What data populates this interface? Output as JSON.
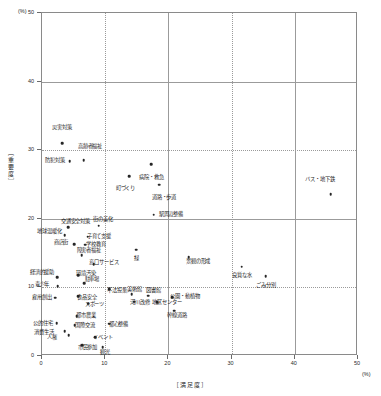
{
  "chart_data": {
    "type": "scatter",
    "title": "",
    "xlabel": "［満足度］",
    "ylabel": "［重要度］",
    "x_unit": "(%)",
    "y_unit": "(%)",
    "xlim": [
      0,
      50
    ],
    "ylim": [
      0,
      50
    ],
    "x_ticks": [
      "0",
      "10",
      "20",
      "30",
      "40",
      "50"
    ],
    "y_ticks": [
      "0",
      "10",
      "20",
      "30",
      "40",
      "50"
    ],
    "grid": true,
    "legend": "none",
    "points": [
      {
        "label": "災害対策",
        "x": 3.2,
        "y": 31.0,
        "lx": 3.2,
        "ly": 33.2
      },
      {
        "label": "防犯対策",
        "x": 4.4,
        "y": 28.4,
        "lx": 2.0,
        "ly": 28.4
      },
      {
        "label": "高齢者福祉",
        "x": 6.6,
        "y": 28.5,
        "lx": 7.6,
        "ly": 30.4
      },
      {
        "label": "病院・救急",
        "x": 17.3,
        "y": 28.0,
        "lx": 17.3,
        "ly": 26.0
      },
      {
        "label": "町づくり",
        "x": 13.8,
        "y": 26.2,
        "lx": 13.2,
        "ly": 24.3
      },
      {
        "label": "道路・歩道",
        "x": 18.5,
        "y": 25.0,
        "lx": 19.3,
        "ly": 23.1
      },
      {
        "label": "バス・地下鉄",
        "x": 45.7,
        "y": 23.6,
        "lx": 44.0,
        "ly": 25.6
      },
      {
        "label": "駅周辺整備",
        "x": 17.7,
        "y": 20.6,
        "lx": 20.4,
        "ly": 20.6
      },
      {
        "label": "交通安全対策",
        "x": 4.1,
        "y": 18.8,
        "lx": 5.3,
        "ly": 19.6
      },
      {
        "label": "街の美化",
        "x": 9.0,
        "y": 19.0,
        "lx": 9.7,
        "ly": 19.8
      },
      {
        "label": "地球温暖化",
        "x": 3.6,
        "y": 17.6,
        "lx": 1.2,
        "ly": 18.1
      },
      {
        "label": "子育て支援",
        "x": 7.2,
        "y": 17.4,
        "lx": 9.0,
        "ly": 17.4
      },
      {
        "label": "商店街",
        "x": 5.1,
        "y": 16.3,
        "lx": 3.0,
        "ly": 16.4
      },
      {
        "label": "学校教育",
        "x": 6.8,
        "y": 16.2,
        "lx": 8.5,
        "ly": 16.2
      },
      {
        "label": "障害者福祉",
        "x": 6.3,
        "y": 14.7,
        "lx": 7.4,
        "ly": 15.3
      },
      {
        "label": "緑",
        "x": 14.9,
        "y": 15.5,
        "lx": 14.9,
        "ly": 14.1
      },
      {
        "label": "景観の形成",
        "x": 23.2,
        "y": 14.4,
        "lx": 24.7,
        "ly": 13.7
      },
      {
        "label": "窓口サービス",
        "x": 8.2,
        "y": 13.4,
        "lx": 9.8,
        "ly": 13.6
      },
      {
        "label": "良質な水",
        "x": 31.6,
        "y": 13.0,
        "lx": 31.6,
        "ly": 11.7
      },
      {
        "label": "経済的援助",
        "x": 2.4,
        "y": 11.5,
        "lx": 0.0,
        "ly": 12.1
      },
      {
        "label": "環境汚染",
        "x": 5.7,
        "y": 11.8,
        "lx": 7.0,
        "ly": 12.0
      },
      {
        "label": "ごみ分別",
        "x": 35.4,
        "y": 11.6,
        "lx": 35.4,
        "ly": 10.2
      },
      {
        "label": "駐車場",
        "x": 6.7,
        "y": 10.6,
        "lx": 7.9,
        "ly": 11.1
      },
      {
        "label": "青少年",
        "x": 2.5,
        "y": 10.2,
        "lx": 0.0,
        "ly": 10.4
      },
      {
        "label": "不法投棄",
        "x": 10.6,
        "y": 9.7,
        "lx": 11.9,
        "ly": 9.5
      },
      {
        "label": "雇用創出",
        "x": 2.1,
        "y": 8.5,
        "lx": 0.0,
        "ly": 8.5
      },
      {
        "label": "食品安全",
        "x": 5.7,
        "y": 8.7,
        "lx": 7.1,
        "ly": 8.5
      },
      {
        "label": "美術館",
        "x": 14.2,
        "y": 9.0,
        "lx": 14.6,
        "ly": 9.6
      },
      {
        "label": "図書館",
        "x": 16.8,
        "y": 8.8,
        "lx": 17.6,
        "ly": 9.5
      },
      {
        "label": "公園・動植物",
        "x": 20.6,
        "y": 8.6,
        "lx": 22.6,
        "ly": 8.6
      },
      {
        "label": "河川改修",
        "x": 14.6,
        "y": 7.9,
        "lx": 15.5,
        "ly": 7.7
      },
      {
        "label": "地区センター",
        "x": 18.2,
        "y": 7.8,
        "lx": 19.8,
        "ly": 7.7
      },
      {
        "label": "スポーツ",
        "x": 7.3,
        "y": 7.6,
        "lx": 8.3,
        "ly": 7.5
      },
      {
        "label": "幹線道路",
        "x": 20.9,
        "y": 6.6,
        "lx": 21.4,
        "ly": 5.9
      },
      {
        "label": "都市農業",
        "x": 5.5,
        "y": 5.8,
        "lx": 7.0,
        "ly": 5.8
      },
      {
        "label": "公的住宅",
        "x": 2.3,
        "y": 4.8,
        "lx": 0.1,
        "ly": 4.7
      },
      {
        "label": "国際交流",
        "x": 5.2,
        "y": 4.5,
        "lx": 6.8,
        "ly": 4.4
      },
      {
        "label": "都心整備",
        "x": 10.6,
        "y": 4.7,
        "lx": 12.1,
        "ly": 4.5
      },
      {
        "label": "消費生活",
        "x": 3.6,
        "y": 3.6,
        "lx": 0.3,
        "ly": 3.4
      },
      {
        "label": "人権",
        "x": 4.2,
        "y": 3.0,
        "lx": 1.6,
        "ly": 2.6
      },
      {
        "label": "イベント",
        "x": 8.4,
        "y": 2.7,
        "lx": 9.6,
        "ly": 2.6
      },
      {
        "label": "市民参加",
        "x": 6.4,
        "y": 1.6,
        "lx": 7.2,
        "ly": 1.2
      },
      {
        "label": "観光",
        "x": 9.6,
        "y": 1.3,
        "lx": 10.0,
        "ly": 0.5
      }
    ]
  }
}
